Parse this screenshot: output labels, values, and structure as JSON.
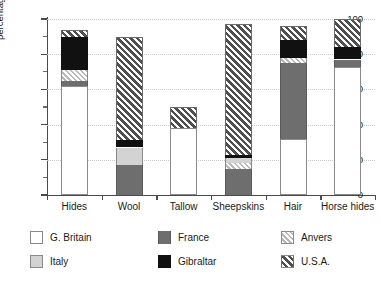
{
  "chart_data": {
    "type": "bar",
    "subtype": "stacked-bar",
    "title": "",
    "xlabel": "",
    "ylabel": "percentage of total item value",
    "ylim": [
      0,
      100
    ],
    "yticks": [
      0,
      20,
      40,
      60,
      80,
      100
    ],
    "yminor_ticks": [
      10,
      30,
      50,
      70,
      90
    ],
    "grid": "horizontal-dotted",
    "legend_position": "bottom",
    "categories": [
      "Hides",
      "Wool",
      "Tallow",
      "Sheepskins",
      "Hair",
      "Horse hides"
    ],
    "series": [
      {
        "name": "G. Britain",
        "color": "#ffffff",
        "pattern": "solid",
        "values": [
          62,
          0,
          38,
          0,
          32,
          73
        ]
      },
      {
        "name": "Italy",
        "color": "#d3d3d3",
        "pattern": "solid",
        "values": [
          0,
          10,
          0,
          3,
          0,
          0
        ]
      },
      {
        "name": "France",
        "color": "#6e6e6e",
        "pattern": "solid",
        "values": [
          3,
          17,
          0,
          15,
          43,
          4
        ]
      },
      {
        "name": "Gibraltar",
        "color": "#111111",
        "pattern": "solid",
        "values": [
          19,
          4,
          0,
          2,
          10,
          7
        ]
      },
      {
        "name": "Anvers",
        "color": "#b9b9b9",
        "pattern": "hatch-light",
        "values": [
          6,
          0,
          0,
          3,
          3,
          0
        ]
      },
      {
        "name": "U.S.A.",
        "color": "#4f4f4f",
        "pattern": "hatch-dark",
        "values": [
          4,
          59,
          12,
          74,
          8,
          16
        ]
      }
    ],
    "stack_order": [
      "G. Britain",
      "France",
      "Anvers",
      "Italy",
      "Gibraltar",
      "U.S.A."
    ],
    "stacks": [
      {
        "category": "Hides",
        "total": 94,
        "segments": [
          {
            "name": "G. Britain",
            "from": 0,
            "to": 62,
            "value": 62
          },
          {
            "name": "France",
            "from": 62,
            "to": 65,
            "value": 3
          },
          {
            "name": "Anvers",
            "from": 65,
            "to": 71,
            "value": 6
          },
          {
            "name": "Gibraltar",
            "from": 71,
            "to": 90,
            "value": 19
          },
          {
            "name": "U.S.A.",
            "from": 90,
            "to": 94,
            "value": 4
          }
        ]
      },
      {
        "category": "Wool",
        "total": 90,
        "segments": [
          {
            "name": "France",
            "from": 0,
            "to": 17,
            "value": 17
          },
          {
            "name": "Italy",
            "from": 17,
            "to": 27,
            "value": 10
          },
          {
            "name": "Gibraltar",
            "from": 27,
            "to": 31,
            "value": 4
          },
          {
            "name": "U.S.A.",
            "from": 31,
            "to": 90,
            "value": 59
          }
        ]
      },
      {
        "category": "Tallow",
        "total": 50,
        "segments": [
          {
            "name": "G. Britain",
            "from": 0,
            "to": 38,
            "value": 38
          },
          {
            "name": "U.S.A.",
            "from": 38,
            "to": 50,
            "value": 12
          }
        ]
      },
      {
        "category": "Sheepskins",
        "total": 97,
        "segments": [
          {
            "name": "France",
            "from": 0,
            "to": 15,
            "value": 15
          },
          {
            "name": "Anvers",
            "from": 15,
            "to": 18,
            "value": 3
          },
          {
            "name": "Italy",
            "from": 18,
            "to": 21,
            "value": 3
          },
          {
            "name": "Gibraltar",
            "from": 21,
            "to": 23,
            "value": 2
          },
          {
            "name": "U.S.A.",
            "from": 23,
            "to": 97,
            "value": 74
          }
        ]
      },
      {
        "category": "Hair",
        "total": 96,
        "segments": [
          {
            "name": "G. Britain",
            "from": 0,
            "to": 32,
            "value": 32
          },
          {
            "name": "France",
            "from": 32,
            "to": 75,
            "value": 43
          },
          {
            "name": "Anvers",
            "from": 75,
            "to": 78,
            "value": 3
          },
          {
            "name": "Gibraltar",
            "from": 78,
            "to": 88,
            "value": 10
          },
          {
            "name": "U.S.A.",
            "from": 88,
            "to": 96,
            "value": 8
          }
        ]
      },
      {
        "category": "Horse hides",
        "total": 100,
        "segments": [
          {
            "name": "G. Britain",
            "from": 0,
            "to": 73,
            "value": 73
          },
          {
            "name": "France",
            "from": 73,
            "to": 77,
            "value": 4
          },
          {
            "name": "Gibraltar",
            "from": 77,
            "to": 84,
            "value": 7
          },
          {
            "name": "U.S.A.",
            "from": 84,
            "to": 100,
            "value": 16
          }
        ]
      }
    ]
  },
  "legend": {
    "entries": [
      {
        "label": "G. Britain",
        "key": "gb",
        "col": 0,
        "row": 0
      },
      {
        "label": "Italy",
        "key": "italy",
        "col": 0,
        "row": 1
      },
      {
        "label": "France",
        "key": "france",
        "col": 1,
        "row": 0
      },
      {
        "label": "Gibraltar",
        "key": "gib",
        "col": 1,
        "row": 1
      },
      {
        "label": "Anvers",
        "key": "anvers",
        "col": 2,
        "row": 0
      },
      {
        "label": "U.S.A.",
        "key": "usa",
        "col": 2,
        "row": 1
      }
    ]
  }
}
